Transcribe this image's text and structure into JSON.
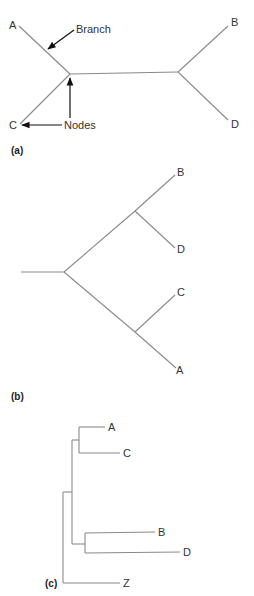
{
  "panels": {
    "a": {
      "label": "(a)",
      "type": "unrooted tree",
      "taxa": {
        "A": "A",
        "B": "B",
        "C": "C",
        "D": "D"
      },
      "annotations": {
        "branch": "Branch",
        "nodes": "Nodes"
      }
    },
    "b": {
      "label": "(b)",
      "type": "rooted tree",
      "taxa": {
        "A": "A",
        "B": "B",
        "C": "C",
        "D": "D"
      }
    },
    "c": {
      "label": "(c)",
      "type": "rooted cladogram with outgroup",
      "taxa": {
        "A": "A",
        "B": "B",
        "C": "C",
        "D": "D",
        "Z": "Z"
      }
    }
  },
  "colors": {
    "branch_line": "#8a8a8a",
    "arrow": "#111111",
    "text": "#333333"
  }
}
